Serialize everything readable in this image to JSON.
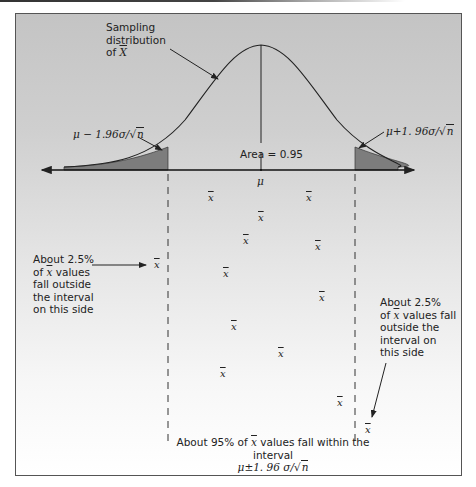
{
  "figure": {
    "type": "sampling_distribution_confidence_interval",
    "labels": {
      "sampling_distribution_line1": "Sampling",
      "sampling_distribution_line2": "distribution",
      "sampling_distribution_line3_prefix": "of ",
      "sampling_distribution_symbol": "X",
      "lower_bound_prefix": "μ − 1.96",
      "lower_bound_sigma": "σ",
      "lower_bound_slash": "/",
      "lower_bound_root": "√",
      "lower_bound_n": "n",
      "upper_bound_prefix": "μ+1. 96",
      "upper_bound_sigma": "σ",
      "upper_bound_slash": "/",
      "upper_bound_root": "√",
      "upper_bound_n": "n",
      "area": "Area = 0.95",
      "mu": "μ",
      "left_note_line1": "About 2.5%",
      "left_note_line2_prefix": "of ",
      "left_note_line2_symbol": "x",
      "left_note_line2_suffix": " values",
      "left_note_line3": "fall outside",
      "left_note_line4": "the interval",
      "left_note_line5": "on this side",
      "right_note_line1": "About 2.5%",
      "right_note_line2_prefix": "of ",
      "right_note_line2_symbol": "x",
      "right_note_line2_suffix": " values fall",
      "right_note_line3": "outside the",
      "right_note_line4": "interval on",
      "right_note_line5": "this side",
      "bottom_note_prefix": "About 95% of ",
      "bottom_note_symbol": "x",
      "bottom_note_suffix": " values fall within the interval",
      "bottom_formula_prefix": "μ±1. 96 ",
      "bottom_formula_sigma": "σ",
      "bottom_formula_slash": "/",
      "bottom_formula_root": "√",
      "bottom_formula_n": "n"
    },
    "xbar_symbol": "x",
    "sample_means": [
      {
        "x": 211,
        "y": 198,
        "position": "inside"
      },
      {
        "x": 309,
        "y": 198,
        "position": "inside"
      },
      {
        "x": 261,
        "y": 218,
        "position": "inside"
      },
      {
        "x": 246,
        "y": 241,
        "position": "inside"
      },
      {
        "x": 318,
        "y": 247,
        "position": "inside"
      },
      {
        "x": 157,
        "y": 265,
        "position": "outside-left"
      },
      {
        "x": 226,
        "y": 274,
        "position": "inside"
      },
      {
        "x": 322,
        "y": 298,
        "position": "inside"
      },
      {
        "x": 234,
        "y": 327,
        "position": "inside"
      },
      {
        "x": 281,
        "y": 354,
        "position": "inside"
      },
      {
        "x": 223,
        "y": 374,
        "position": "inside"
      },
      {
        "x": 340,
        "y": 403,
        "position": "inside"
      },
      {
        "x": 368,
        "y": 430,
        "position": "outside-right"
      }
    ],
    "colors": {
      "curve": "#222222",
      "tail_fill": "#7d7d7d",
      "background_top": "#c4c4c4",
      "background_bottom": "#ffffff"
    }
  }
}
